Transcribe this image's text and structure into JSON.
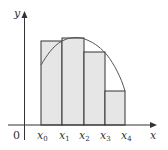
{
  "diagram": {
    "type": "riemann_sum",
    "axes": {
      "x_label": "x",
      "y_label": "y",
      "origin_label": "0"
    },
    "partition_labels": [
      {
        "base": "x",
        "sub": "0"
      },
      {
        "base": "x",
        "sub": "1"
      },
      {
        "base": "x",
        "sub": "2"
      },
      {
        "base": "x",
        "sub": "3"
      },
      {
        "base": "x",
        "sub": "4"
      }
    ],
    "rectangles": [
      {
        "from": "x0",
        "to": "x1",
        "height_at": "x1"
      },
      {
        "from": "x1",
        "to": "x2",
        "height_at": "x2"
      },
      {
        "from": "x2",
        "to": "x3",
        "height_at": "x3"
      },
      {
        "from": "x3",
        "to": "x4",
        "height_at": "x4"
      }
    ],
    "colors": {
      "fill": "#e6e6e6",
      "stroke": "#333333",
      "curve": "#555555",
      "axis": "#333333"
    }
  }
}
